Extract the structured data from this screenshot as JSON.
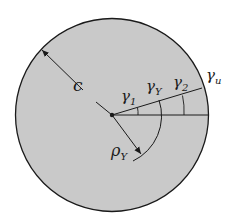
{
  "diagram": {
    "colors": {
      "background": "#ffffff",
      "disk_fill": "#c9c9c9",
      "stroke": "#1a1a1a"
    },
    "labels": {
      "radius": "c",
      "gamma1_base": "γ",
      "gamma1_sub": "1",
      "gammaY_base": "γ",
      "gammaY_sub": "Y",
      "gamma2_base": "γ",
      "gamma2_sub": "2",
      "gammau_base": "γ",
      "gammau_sub": "u",
      "rho_base": "ρ",
      "rho_sub": "Y"
    }
  }
}
